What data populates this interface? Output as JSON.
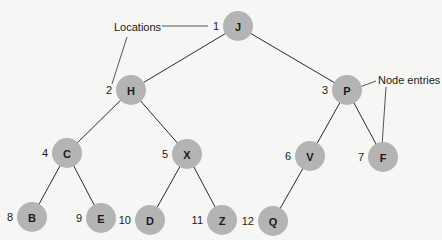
{
  "diagram": {
    "annotations": {
      "locations_label": "Locations",
      "node_entries_label": "Node entries"
    },
    "colors": {
      "node_fill": "#b4b4b4",
      "line": "#2a2a2a",
      "background": "#f6f6f4"
    },
    "nodes": [
      {
        "location": "1",
        "entry": "J"
      },
      {
        "location": "2",
        "entry": "H"
      },
      {
        "location": "3",
        "entry": "P"
      },
      {
        "location": "4",
        "entry": "C"
      },
      {
        "location": "5",
        "entry": "X"
      },
      {
        "location": "6",
        "entry": "V"
      },
      {
        "location": "7",
        "entry": "F"
      },
      {
        "location": "8",
        "entry": "B"
      },
      {
        "location": "9",
        "entry": "E"
      },
      {
        "location": "10",
        "entry": "D"
      },
      {
        "location": "11",
        "entry": "Z"
      },
      {
        "location": "12",
        "entry": "Q"
      }
    ],
    "edges": [
      [
        "1",
        "2"
      ],
      [
        "1",
        "3"
      ],
      [
        "2",
        "4"
      ],
      [
        "2",
        "5"
      ],
      [
        "3",
        "6"
      ],
      [
        "3",
        "7"
      ],
      [
        "4",
        "8"
      ],
      [
        "4",
        "9"
      ],
      [
        "5",
        "10"
      ],
      [
        "5",
        "11"
      ],
      [
        "6",
        "12"
      ]
    ]
  }
}
